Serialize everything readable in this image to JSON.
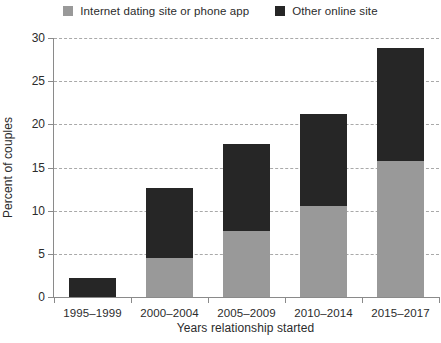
{
  "chart_data": {
    "type": "bar",
    "stacked": true,
    "title": "",
    "subtitle": "",
    "xlabel": "Years relationship started",
    "ylabel": "Percent of couples",
    "categories": [
      "1995–1999",
      "2000–2004",
      "2005–2009",
      "2010–2014",
      "2015–2017"
    ],
    "series": [
      {
        "name": "Internet dating site or phone app",
        "color": "#999999",
        "values": [
          0,
          4.5,
          7.6,
          10.6,
          15.7
        ]
      },
      {
        "name": "Other online site",
        "color": "#262626",
        "values": [
          2.2,
          8.1,
          10.1,
          10.6,
          13.1
        ]
      }
    ],
    "totals": [
      2.2,
      12.6,
      17.7,
      21.2,
      28.8
    ],
    "ylim": [
      0,
      30
    ],
    "yticks": [
      0,
      5,
      10,
      15,
      20,
      25,
      30
    ],
    "ytick_labels": [
      "0",
      "5",
      "10",
      "15",
      "20",
      "25",
      "30"
    ],
    "grid": "horizontal-dashed",
    "legend_position": "top-center"
  },
  "legend": {
    "items": [
      {
        "label": "Internet dating site or phone app",
        "color": "#999999",
        "swatch_name": "legend-swatch-dating-app"
      },
      {
        "label": "Other online site",
        "color": "#262626",
        "swatch_name": "legend-swatch-other-online"
      }
    ]
  },
  "axes": {
    "y_title": "Percent of couples",
    "x_title": "Years relationship started",
    "y_tick_labels": [
      "0",
      "5",
      "10",
      "15",
      "20",
      "25",
      "30"
    ],
    "x_tick_labels": [
      "1995–1999",
      "2000–2004",
      "2005–2009",
      "2010–2014",
      "2015–2017"
    ]
  },
  "colors": {
    "series_gray": "#999999",
    "series_dark": "#262626",
    "axis": "#8a8a8a",
    "grid": "#a9a9a9",
    "text": "#2b2b2b",
    "background": "#ffffff"
  }
}
